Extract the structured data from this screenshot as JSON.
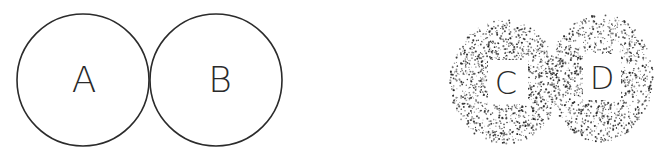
{
  "diagram": {
    "left_group": {
      "description": "two touching outlined circles",
      "circles": [
        {
          "label": "A",
          "cx": 83,
          "cy": 80,
          "r": 66
        },
        {
          "label": "B",
          "cx": 216,
          "cy": 80,
          "r": 66
        }
      ],
      "stroke_color": "#2b2b2b"
    },
    "right_group": {
      "description": "two letters in clear square windows surrounded by stippled dot clouds",
      "regions": [
        {
          "label": "C",
          "cx": 505,
          "cy": 80
        },
        {
          "label": "D",
          "cx": 601,
          "cy": 76
        }
      ],
      "dot_color": "#1e1e1e"
    }
  }
}
